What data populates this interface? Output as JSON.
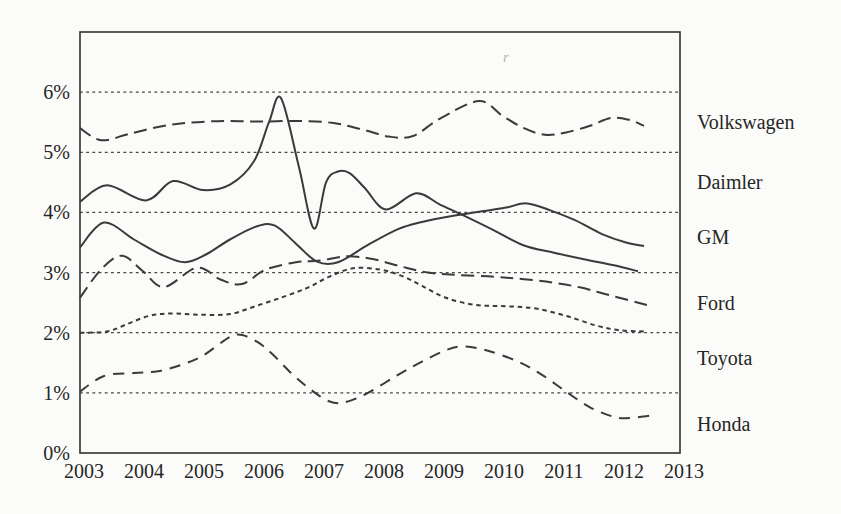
{
  "figure": {
    "background_color": "#fbfbf9",
    "ink_color": "#3a3a3a",
    "artifact_mark": "r"
  },
  "chart_data": {
    "type": "line",
    "title": "",
    "xlabel": "",
    "ylabel": "",
    "xlim": [
      2003,
      2013
    ],
    "ylim": [
      0,
      7
    ],
    "x_tick_labels": [
      "2003",
      "2004",
      "2005",
      "2006",
      "2007",
      "2008",
      "2009",
      "2010",
      "2011",
      "2012",
      "2013"
    ],
    "x_tick_values": [
      2003,
      2004,
      2005,
      2006,
      2007,
      2008,
      2009,
      2010,
      2011,
      2012,
      2013
    ],
    "y_tick_labels": [
      "0%",
      "1%",
      "2%",
      "3%",
      "4%",
      "5%",
      "6%"
    ],
    "y_tick_values": [
      0,
      1,
      2,
      3,
      4,
      5,
      6
    ],
    "grid": "horizontal-dotted",
    "legend_position": "right-outside",
    "series": [
      {
        "name": "Volkswagen",
        "line_style": "long-dash",
        "points": [
          [
            2003,
            5.4
          ],
          [
            2003.35,
            5.2
          ],
          [
            2003.8,
            5.3
          ],
          [
            2004.3,
            5.42
          ],
          [
            2004.8,
            5.49
          ],
          [
            2005.4,
            5.52
          ],
          [
            2006.0,
            5.51
          ],
          [
            2006.6,
            5.52
          ],
          [
            2007.2,
            5.49
          ],
          [
            2007.7,
            5.38
          ],
          [
            2008.15,
            5.26
          ],
          [
            2008.55,
            5.27
          ],
          [
            2009.0,
            5.56
          ],
          [
            2009.65,
            5.85
          ],
          [
            2010.05,
            5.6
          ],
          [
            2010.4,
            5.4
          ],
          [
            2010.75,
            5.29
          ],
          [
            2011.1,
            5.33
          ],
          [
            2011.5,
            5.44
          ],
          [
            2011.85,
            5.57
          ],
          [
            2012.15,
            5.54
          ],
          [
            2012.4,
            5.44
          ]
        ]
      },
      {
        "name": "Daimler",
        "line_style": "solid",
        "points": [
          [
            2003,
            4.18
          ],
          [
            2003.45,
            4.45
          ],
          [
            2004.1,
            4.2
          ],
          [
            2004.55,
            4.52
          ],
          [
            2005.05,
            4.37
          ],
          [
            2005.5,
            4.46
          ],
          [
            2005.9,
            4.85
          ],
          [
            2006.15,
            5.5
          ],
          [
            2006.35,
            5.9
          ],
          [
            2006.65,
            4.75
          ],
          [
            2006.9,
            3.73
          ],
          [
            2007.1,
            4.5
          ],
          [
            2007.3,
            4.68
          ],
          [
            2007.5,
            4.65
          ],
          [
            2007.75,
            4.4
          ],
          [
            2008.1,
            4.05
          ],
          [
            2008.6,
            4.32
          ],
          [
            2009.0,
            4.13
          ],
          [
            2009.45,
            3.92
          ],
          [
            2009.9,
            3.7
          ],
          [
            2010.4,
            3.45
          ],
          [
            2010.9,
            3.33
          ],
          [
            2011.4,
            3.22
          ],
          [
            2011.9,
            3.12
          ],
          [
            2012.3,
            3.02
          ]
        ]
      },
      {
        "name": "GM",
        "line_style": "solid",
        "points": [
          [
            2003,
            3.42
          ],
          [
            2003.4,
            3.83
          ],
          [
            2003.9,
            3.55
          ],
          [
            2004.35,
            3.3
          ],
          [
            2004.75,
            3.17
          ],
          [
            2005.1,
            3.3
          ],
          [
            2005.5,
            3.55
          ],
          [
            2005.95,
            3.77
          ],
          [
            2006.25,
            3.78
          ],
          [
            2006.6,
            3.48
          ],
          [
            2006.95,
            3.18
          ],
          [
            2007.3,
            3.17
          ],
          [
            2007.8,
            3.46
          ],
          [
            2008.3,
            3.72
          ],
          [
            2008.7,
            3.84
          ],
          [
            2009.2,
            3.94
          ],
          [
            2009.7,
            4.02
          ],
          [
            2010.1,
            4.08
          ],
          [
            2010.45,
            4.15
          ],
          [
            2010.85,
            4.03
          ],
          [
            2011.25,
            3.87
          ],
          [
            2011.7,
            3.64
          ],
          [
            2012.1,
            3.5
          ],
          [
            2012.4,
            3.44
          ]
        ]
      },
      {
        "name": "Ford",
        "line_style": "long-dash",
        "points": [
          [
            2003,
            2.58
          ],
          [
            2003.35,
            3.05
          ],
          [
            2003.7,
            3.28
          ],
          [
            2004.05,
            3.02
          ],
          [
            2004.4,
            2.76
          ],
          [
            2004.95,
            3.08
          ],
          [
            2005.35,
            2.88
          ],
          [
            2005.7,
            2.81
          ],
          [
            2006.1,
            3.05
          ],
          [
            2006.6,
            3.17
          ],
          [
            2007.0,
            3.2
          ],
          [
            2007.45,
            3.27
          ],
          [
            2007.9,
            3.22
          ],
          [
            2008.35,
            3.1
          ],
          [
            2008.8,
            3.0
          ],
          [
            2009.3,
            2.96
          ],
          [
            2009.9,
            2.93
          ],
          [
            2010.4,
            2.89
          ],
          [
            2010.9,
            2.83
          ],
          [
            2011.35,
            2.75
          ],
          [
            2011.8,
            2.63
          ],
          [
            2012.45,
            2.46
          ]
        ]
      },
      {
        "name": "Toyota",
        "line_style": "short-dash",
        "points": [
          [
            2003,
            2.0
          ],
          [
            2003.45,
            2.02
          ],
          [
            2003.8,
            2.15
          ],
          [
            2004.15,
            2.28
          ],
          [
            2004.5,
            2.32
          ],
          [
            2005.0,
            2.3
          ],
          [
            2005.5,
            2.31
          ],
          [
            2005.95,
            2.45
          ],
          [
            2006.4,
            2.6
          ],
          [
            2006.8,
            2.75
          ],
          [
            2007.15,
            2.93
          ],
          [
            2007.55,
            3.07
          ],
          [
            2008.0,
            3.05
          ],
          [
            2008.35,
            2.95
          ],
          [
            2008.7,
            2.78
          ],
          [
            2009.1,
            2.58
          ],
          [
            2009.6,
            2.46
          ],
          [
            2010.1,
            2.44
          ],
          [
            2010.6,
            2.4
          ],
          [
            2011.1,
            2.28
          ],
          [
            2011.6,
            2.12
          ],
          [
            2012.0,
            2.04
          ],
          [
            2012.4,
            2.02
          ]
        ]
      },
      {
        "name": "Honda",
        "line_style": "med-dash",
        "points": [
          [
            2003,
            1.02
          ],
          [
            2003.4,
            1.28
          ],
          [
            2003.9,
            1.33
          ],
          [
            2004.3,
            1.36
          ],
          [
            2004.7,
            1.47
          ],
          [
            2005.05,
            1.62
          ],
          [
            2005.5,
            1.93
          ],
          [
            2005.7,
            1.96
          ],
          [
            2005.95,
            1.85
          ],
          [
            2006.2,
            1.65
          ],
          [
            2006.55,
            1.3
          ],
          [
            2006.85,
            1.05
          ],
          [
            2007.15,
            0.86
          ],
          [
            2007.4,
            0.84
          ],
          [
            2007.8,
            1.0
          ],
          [
            2008.3,
            1.3
          ],
          [
            2008.7,
            1.52
          ],
          [
            2009.1,
            1.71
          ],
          [
            2009.4,
            1.77
          ],
          [
            2009.8,
            1.7
          ],
          [
            2010.3,
            1.52
          ],
          [
            2010.7,
            1.3
          ],
          [
            2011.1,
            1.02
          ],
          [
            2011.5,
            0.76
          ],
          [
            2011.9,
            0.6
          ],
          [
            2012.15,
            0.58
          ],
          [
            2012.5,
            0.62
          ]
        ]
      }
    ]
  }
}
